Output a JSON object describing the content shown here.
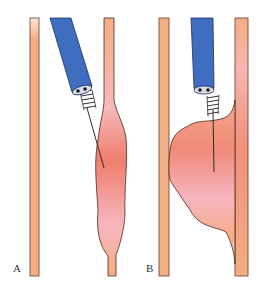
{
  "figure": {
    "panels": [
      {
        "id": "A",
        "label": "A",
        "description": "Endoscopic needle injection into vessel/esophageal wall causing fusiform swelling"
      },
      {
        "id": "B",
        "label": "B",
        "description": "Injection causing large bulging swelling into lumen"
      }
    ],
    "colors": {
      "wall": "#f2ae84",
      "wall_outline": "#6b3a2a",
      "catheter": "#3f6dc0",
      "catheter_outline": "#1f2f5a",
      "swelling_top": "#f5a08a",
      "swelling_mid": "#f07a6a",
      "swelling_pink": "#f6b6bf",
      "swelling_bottom": "#f6ad84"
    }
  }
}
